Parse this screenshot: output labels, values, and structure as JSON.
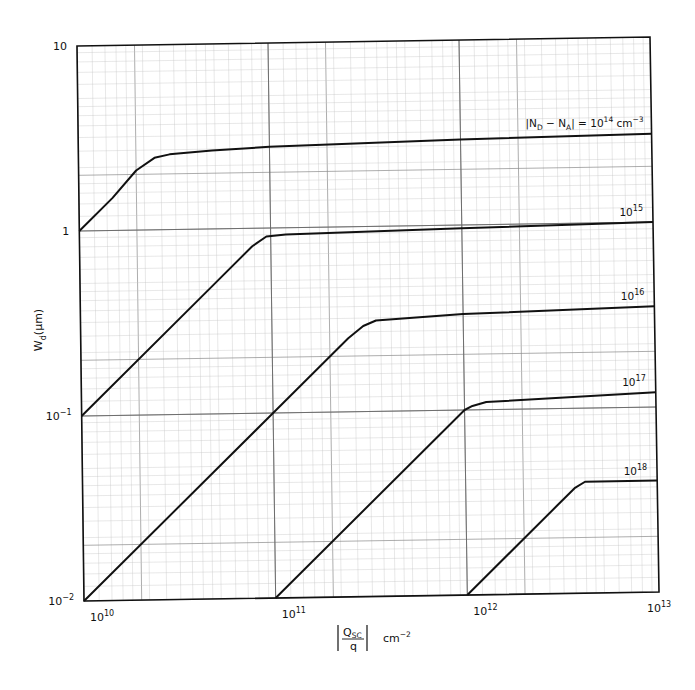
{
  "chart_data": {
    "type": "line",
    "title": "",
    "xscale": "log",
    "yscale": "log",
    "xlabel": "|Q_SC / q|  cm^-2",
    "ylabel": "W_d (μm)",
    "xlim": [
      10000000000.0,
      10000000000000.0
    ],
    "ylim": [
      0.01,
      10
    ],
    "grid": true,
    "x_ticks": [
      {
        "value": 10000000000.0,
        "base": "10",
        "exp": "10"
      },
      {
        "value": 100000000000.0,
        "base": "10",
        "exp": "11"
      },
      {
        "value": 1000000000000.0,
        "base": "10",
        "exp": "12"
      },
      {
        "value": 10000000000000.0,
        "base": "10",
        "exp": "13"
      }
    ],
    "y_ticks": [
      {
        "value": 0.01,
        "base": "10",
        "exp": "−2"
      },
      {
        "value": 0.1,
        "base": "10",
        "exp": "−1"
      },
      {
        "value": 1,
        "base": "1",
        "exp": ""
      },
      {
        "value": 10,
        "base": "10",
        "exp": ""
      }
    ],
    "series": [
      {
        "name": "|N_D − N_A| = 10^14 cm^-3",
        "doping": 100000000000000.0,
        "label_base": "10",
        "label_exp": "14",
        "label_prefix": "|N",
        "label_full": true,
        "x": [
          10000000000.0,
          15000000000.0,
          20000000000.0,
          25000000000.0,
          30000000000.0,
          50000000000.0,
          100000000000.0,
          1000000000000.0,
          10000000000000.0
        ],
        "y": [
          1.0,
          1.5,
          2.1,
          2.45,
          2.55,
          2.65,
          2.75,
          2.9,
          3.0
        ]
      },
      {
        "name": "10^15",
        "doping": 1000000000000000.0,
        "label_base": "10",
        "label_exp": "15",
        "x": [
          10000000000.0,
          50000000000.0,
          80000000000.0,
          95000000000.0,
          120000000000.0,
          1000000000000.0,
          10000000000000.0
        ],
        "y": [
          0.1,
          0.5,
          0.8,
          0.9,
          0.92,
          0.96,
          1.0
        ]
      },
      {
        "name": "10^16",
        "doping": 1e+16,
        "label_base": "10",
        "label_exp": "16",
        "x": [
          10000000000.0,
          100000000000.0,
          250000000000.0,
          300000000000.0,
          350000000000.0,
          1000000000000.0,
          10000000000000.0
        ],
        "y": [
          0.01,
          0.1,
          0.25,
          0.29,
          0.31,
          0.33,
          0.35
        ]
      },
      {
        "name": "10^17",
        "doping": 1e+17,
        "label_base": "10",
        "label_exp": "17",
        "x": [
          100000000000.0,
          1000000000000.0,
          1100000000000.0,
          1300000000000.0,
          10000000000000.0
        ],
        "y": [
          0.01,
          0.1,
          0.105,
          0.11,
          0.12
        ]
      },
      {
        "name": "10^18",
        "doping": 1e+18,
        "label_base": "10",
        "label_exp": "18",
        "x": [
          1000000000000.0,
          3000000000000.0,
          3700000000000.0,
          4200000000000.0,
          10000000000000.0
        ],
        "y": [
          0.01,
          0.03,
          0.037,
          0.04,
          0.04
        ]
      }
    ],
    "curve_labels": {
      "main_prefix": "|N",
      "main_sub_d": "D",
      "main_mid": " − N",
      "main_sub_a": "A",
      "main_suffix_eq": "| = 10",
      "main_exp": "14",
      "main_unit": " cm",
      "main_unit_exp": "−3"
    },
    "x_axis_label": {
      "num": "Q",
      "num_sub": "SC",
      "den": "q",
      "unit": "cm",
      "unit_exp": "−2"
    },
    "y_axis_label": {
      "main": "W",
      "sub": "d",
      "unit": "(μm)"
    }
  }
}
